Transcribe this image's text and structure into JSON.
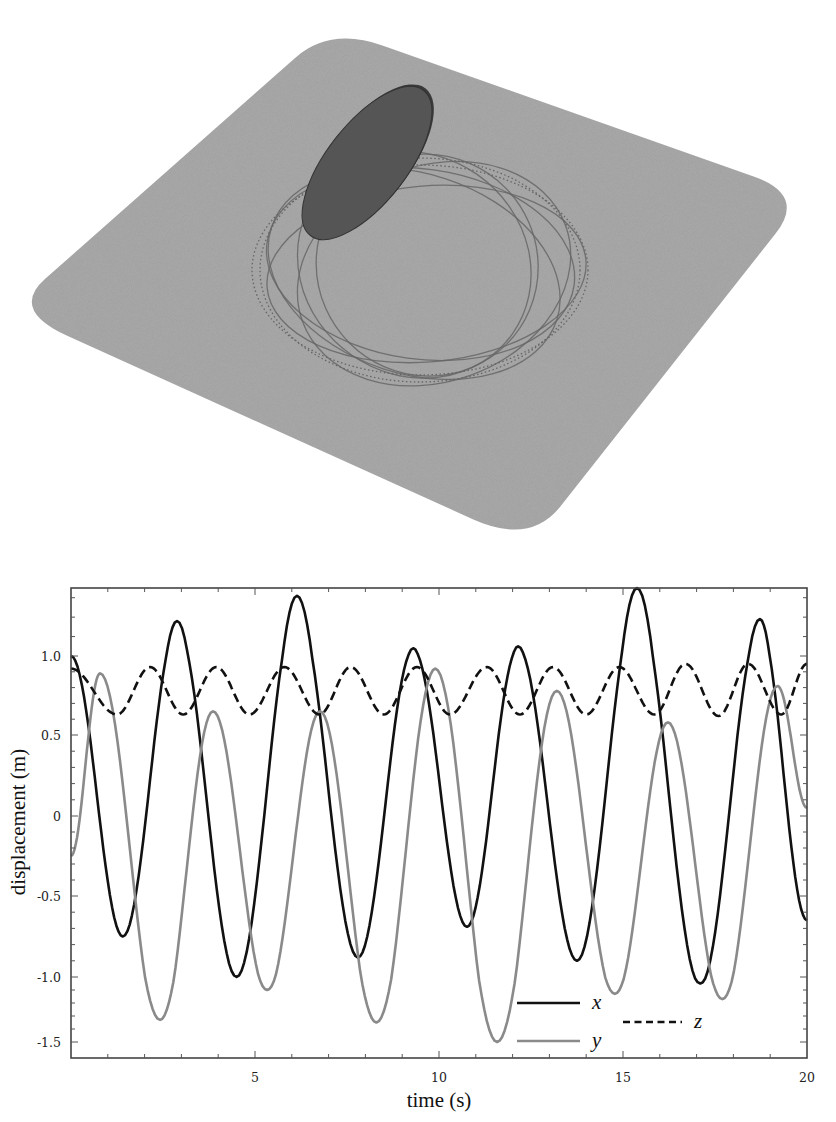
{
  "scene": {
    "platform_color": "#a9a9a9",
    "platform_corners": [
      [
        330,
        27
      ],
      [
        806,
        195
      ],
      [
        530,
        545
      ],
      [
        10,
        310
      ]
    ],
    "disk": {
      "cx": 367,
      "cy": 163,
      "rx": 92,
      "ry": 40,
      "rotate": -52,
      "color": "#555555",
      "rim": "#3a3a3a"
    },
    "orbit": {
      "cx": 420,
      "cy": 268,
      "color": "#666666"
    }
  },
  "chart_data": {
    "type": "line",
    "title": "",
    "xlabel": "time (s)",
    "ylabel": "displacement (m)",
    "xlim": [
      0,
      20
    ],
    "ylim": [
      -1.6,
      1.35
    ],
    "xticks": [
      5,
      10,
      15,
      20
    ],
    "xtick_labels": [
      "5",
      "10",
      "15",
      "20"
    ],
    "yticks": [
      1.0,
      0.5,
      0,
      -0.5,
      -1.0,
      -1.5
    ],
    "ytick_labels": [
      "1.0",
      "0.5",
      "0",
      "-0.5",
      "-1.0",
      "-1.5"
    ],
    "grid": false,
    "legend_position": "lower right",
    "series": [
      {
        "name": "x",
        "style": "solid",
        "color": "#111111",
        "keypoints": [
          [
            0,
            1.0
          ],
          [
            1.41,
            -0.75
          ],
          [
            2.88,
            1.18
          ],
          [
            4.5,
            -1.0
          ],
          [
            6.14,
            1.31
          ],
          [
            7.8,
            -0.88
          ],
          [
            9.3,
            1.04
          ],
          [
            10.76,
            -0.69
          ],
          [
            12.15,
            1.05
          ],
          [
            13.75,
            -0.9
          ],
          [
            15.38,
            1.35
          ],
          [
            17.1,
            -1.05
          ],
          [
            18.72,
            1.19
          ],
          [
            20,
            -0.65
          ]
        ]
      },
      {
        "name": "y",
        "style": "solid",
        "color": "#8a8a8a",
        "keypoints": [
          [
            0,
            -0.25
          ],
          [
            0.79,
            0.89
          ],
          [
            2.42,
            -1.33
          ],
          [
            3.86,
            0.65
          ],
          [
            5.33,
            -1.1
          ],
          [
            6.77,
            0.65
          ],
          [
            8.3,
            -1.35
          ],
          [
            9.9,
            0.92
          ],
          [
            11.58,
            -1.5
          ],
          [
            13.2,
            0.78
          ],
          [
            14.78,
            -1.13
          ],
          [
            16.22,
            0.58
          ],
          [
            17.7,
            -1.17
          ],
          [
            19.2,
            0.81
          ],
          [
            20,
            0.05
          ]
        ]
      },
      {
        "name": "z",
        "style": "dashed",
        "color": "#111111",
        "keypoints": [
          [
            0,
            0.92
          ],
          [
            1.25,
            0.63
          ],
          [
            2.15,
            0.93
          ],
          [
            3.05,
            0.63
          ],
          [
            3.95,
            0.93
          ],
          [
            4.85,
            0.63
          ],
          [
            5.8,
            0.93
          ],
          [
            6.75,
            0.63
          ],
          [
            7.6,
            0.93
          ],
          [
            8.5,
            0.63
          ],
          [
            9.4,
            0.93
          ],
          [
            10.3,
            0.63
          ],
          [
            11.3,
            0.93
          ],
          [
            12.2,
            0.63
          ],
          [
            13.1,
            0.93
          ],
          [
            14.0,
            0.63
          ],
          [
            14.9,
            0.93
          ],
          [
            15.85,
            0.63
          ],
          [
            16.7,
            0.95
          ],
          [
            17.6,
            0.62
          ],
          [
            18.4,
            0.95
          ],
          [
            19.3,
            0.63
          ],
          [
            20,
            0.95
          ]
        ]
      }
    ]
  },
  "plot": {
    "frame": {
      "left": 71,
      "right": 807,
      "top": 28,
      "bottom": 498
    },
    "y_pixel_map": [
      [
        1.35,
        28
      ],
      [
        1.0,
        96
      ],
      [
        0.5,
        175
      ],
      [
        0,
        256
      ],
      [
        -0.5,
        336
      ],
      [
        -1.0,
        417
      ],
      [
        -1.5,
        482
      ],
      [
        -1.6,
        498
      ]
    ],
    "legend": {
      "x": {
        "label": "x",
        "line": [
          517,
          580,
          443
        ],
        "text_x": 592
      },
      "y": {
        "label": "y",
        "line": [
          517,
          580,
          481
        ],
        "text_x": 592
      },
      "z": {
        "label": "z",
        "line": [
          623,
          682,
          462
        ],
        "text_x": 694
      }
    }
  }
}
